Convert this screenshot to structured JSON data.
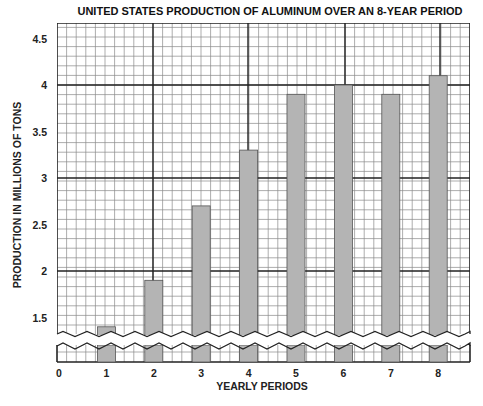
{
  "chart_data": {
    "type": "bar",
    "title": "UNITED STATES PRODUCTION OF ALUMINUM OVER AN 8-YEAR PERIOD",
    "xlabel": "YEARLY PERIODS",
    "ylabel": "PRODUCTION IN MILLIONS OF TONS",
    "x_ticks": [
      "0",
      "1",
      "2",
      "3",
      "4",
      "5",
      "6",
      "7",
      "8"
    ],
    "categories": [
      "1",
      "2",
      "3",
      "4",
      "5",
      "6",
      "7",
      "8"
    ],
    "values": [
      1.4,
      1.9,
      2.7,
      3.3,
      3.9,
      4.0,
      3.9,
      4.1
    ],
    "y_ticks": [
      "1.5",
      "2",
      "2.5",
      "3",
      "3.5",
      "4",
      "4.5"
    ],
    "ylim": [
      1.3,
      4.7
    ],
    "axis_break": true,
    "grid": true,
    "legend": "none",
    "bar_color": "#b4b4b4",
    "grid_color": "#8a8a8a",
    "major_grid_color": "#222222"
  }
}
